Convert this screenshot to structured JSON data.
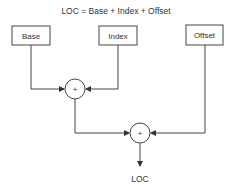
{
  "title": "LOC = Base + Index + Offset",
  "boxes": {
    "base": "Base",
    "index": "Index",
    "offset": "Offset"
  },
  "adders": {
    "first": "+",
    "second": "+"
  },
  "output": "LOC",
  "colors": {
    "stroke": "#444444",
    "text": "#333333"
  }
}
